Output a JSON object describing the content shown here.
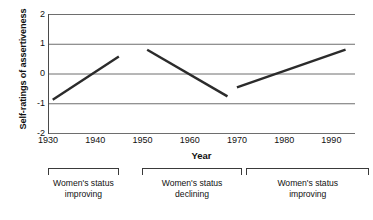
{
  "chart_data": {
    "type": "line",
    "title": "",
    "xlabel": "Year",
    "ylabel": "Self-ratings of assertiveness",
    "xlim": [
      1930,
      1995
    ],
    "ylim": [
      -2,
      2
    ],
    "grid": true,
    "legend": false,
    "x_ticks": [
      1930,
      1940,
      1950,
      1960,
      1970,
      1980,
      1990
    ],
    "x_tick_labels": [
      "1930",
      "1940",
      "1950",
      "1960",
      "1970",
      "1980",
      "1990"
    ],
    "y_ticks": [
      2,
      1,
      0,
      -1,
      -2
    ],
    "y_tick_labels": [
      "2",
      "1",
      "0",
      "-1",
      "-2"
    ],
    "series": [
      {
        "name": "Women's status improving (1931-1945)",
        "points": [
          {
            "x": 1931,
            "y": -0.88
          },
          {
            "x": 1945,
            "y": 0.57
          }
        ]
      },
      {
        "name": "Women's status declining (1951-1968)",
        "points": [
          {
            "x": 1951,
            "y": 0.8
          },
          {
            "x": 1968,
            "y": -0.77
          }
        ]
      },
      {
        "name": "Women's status improving (1970-1993)",
        "points": [
          {
            "x": 1970,
            "y": -0.47
          },
          {
            "x": 1993,
            "y": 0.8
          }
        ]
      }
    ],
    "annotations": [
      {
        "line1": "Women's status",
        "line2": "improving",
        "span_start": 1930,
        "span_end": 1945
      },
      {
        "line1": "Women's status",
        "line2": "declining",
        "span_start": 1950,
        "span_end": 1971
      },
      {
        "line1": "Women's status",
        "line2": "improving",
        "span_start": 1972,
        "span_end": 1998
      }
    ],
    "colors": {
      "line": "#2b2b2b",
      "grid": "#6e6e6e",
      "axis": "#4a4a4a",
      "text": "#111111",
      "background": "#ffffff"
    }
  }
}
